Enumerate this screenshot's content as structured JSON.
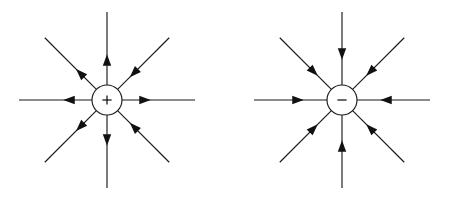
{
  "figure": {
    "background_color": "#ffffff",
    "line_color": "#1a1a1a",
    "arrow_color": "#111111",
    "width": 451,
    "height": 197
  },
  "diagrams": [
    {
      "id": "positive-charge",
      "label": "+",
      "sign_name": "plus-sign",
      "center_x": 107,
      "center_y": 100,
      "radius": 15,
      "line_length": 88,
      "description": "Point charge with eight radial field lines",
      "lines": [
        {
          "name": "field-line-right",
          "angle_deg": 0,
          "arrow_distance": 38,
          "arrow_direction": "outward"
        },
        {
          "name": "field-line-up-right",
          "angle_deg": 315,
          "arrow_distance": 38,
          "arrow_direction": "inward"
        },
        {
          "name": "field-line-up",
          "angle_deg": 270,
          "arrow_distance": 40,
          "arrow_direction": "outward"
        },
        {
          "name": "field-line-up-left",
          "angle_deg": 225,
          "arrow_distance": 38,
          "arrow_direction": "outward"
        },
        {
          "name": "field-line-left",
          "angle_deg": 180,
          "arrow_distance": 38,
          "arrow_direction": "outward"
        },
        {
          "name": "field-line-down-left",
          "angle_deg": 135,
          "arrow_distance": 38,
          "arrow_direction": "outward"
        },
        {
          "name": "field-line-down",
          "angle_deg": 90,
          "arrow_distance": 40,
          "arrow_direction": "outward"
        },
        {
          "name": "field-line-down-right",
          "angle_deg": 45,
          "arrow_distance": 38,
          "arrow_direction": "inward"
        }
      ]
    },
    {
      "id": "negative-charge",
      "label": "−",
      "sign_name": "minus-sign",
      "center_x": 342,
      "center_y": 100,
      "radius": 15,
      "line_length": 88,
      "description": "Point charge with eight radial field lines directed inward",
      "lines": [
        {
          "name": "field-line-right",
          "angle_deg": 0,
          "arrow_distance": 44,
          "arrow_direction": "inward"
        },
        {
          "name": "field-line-up-right",
          "angle_deg": 315,
          "arrow_distance": 40,
          "arrow_direction": "inward"
        },
        {
          "name": "field-line-up",
          "angle_deg": 270,
          "arrow_distance": 46,
          "arrow_direction": "inward"
        },
        {
          "name": "field-line-up-left",
          "angle_deg": 225,
          "arrow_distance": 40,
          "arrow_direction": "inward"
        },
        {
          "name": "field-line-left",
          "angle_deg": 180,
          "arrow_distance": 44,
          "arrow_direction": "inward"
        },
        {
          "name": "field-line-down-left",
          "angle_deg": 135,
          "arrow_distance": 40,
          "arrow_direction": "inward"
        },
        {
          "name": "field-line-down",
          "angle_deg": 90,
          "arrow_distance": 46,
          "arrow_direction": "inward"
        },
        {
          "name": "field-line-down-right",
          "angle_deg": 45,
          "arrow_distance": 40,
          "arrow_direction": "inward"
        }
      ]
    }
  ]
}
